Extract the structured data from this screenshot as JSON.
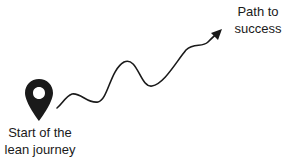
{
  "diagram": {
    "start": {
      "label_line1": "Start of the",
      "label_line2": "lean journey",
      "icon": "map-pin-icon"
    },
    "end": {
      "label_line1": "Path to",
      "label_line2": "success",
      "icon": "arrow-icon"
    },
    "colors": {
      "ink": "#1a1a1a",
      "background": "#ffffff"
    }
  }
}
